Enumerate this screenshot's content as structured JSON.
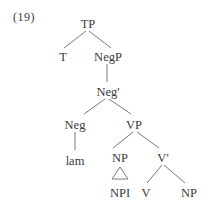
{
  "example_number": "(19)",
  "tree": {
    "nodes": {
      "tp": "TP",
      "t": "T",
      "negp": "NegP",
      "neg_bar": "Neg'",
      "neg": "Neg",
      "lam": "lam",
      "vp": "VP",
      "np_subj": "NP",
      "npi": "NPI",
      "v_bar": "V'",
      "v": "V",
      "np_obj": "NP"
    },
    "edges": [
      [
        "TP",
        "T"
      ],
      [
        "TP",
        "NegP"
      ],
      [
        "NegP",
        "Neg'"
      ],
      [
        "Neg'",
        "Neg"
      ],
      [
        "Neg'",
        "VP"
      ],
      [
        "Neg",
        "lam"
      ],
      [
        "VP",
        "NP"
      ],
      [
        "VP",
        "V'"
      ],
      [
        "NP",
        "NPI (triangle)"
      ],
      [
        "V'",
        "V"
      ],
      [
        "V'",
        "NP"
      ]
    ]
  }
}
